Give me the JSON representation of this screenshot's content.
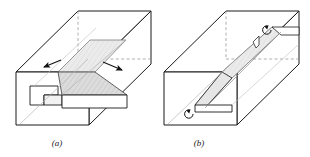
{
  "figure": {
    "background_color": "#ffffff",
    "line_color": "#1a1a1a",
    "hidden_line_color": "#8a8a8a",
    "slip_plane_fill": "#d4d4d4",
    "slip_plane_fill_light": "#e2e2e2",
    "top_face_fill": "#ffffff",
    "front_face_fill": "#ffffff"
  },
  "panels": [
    {
      "id": "a",
      "caption": "(a)",
      "caption_x": 57,
      "caption_y": 146,
      "dislocation_type": "edge",
      "annotations": [
        {
          "name": "shear-arrow-left",
          "symbol": "straight-arrow",
          "direction": "left",
          "x": 45,
          "y": 63
        },
        {
          "name": "shear-arrow-right",
          "symbol": "straight-arrow",
          "direction": "right",
          "x": 118,
          "y": 68
        }
      ]
    },
    {
      "id": "b",
      "caption": "(b)",
      "caption_x": 199,
      "caption_y": 146,
      "dislocation_type": "screw",
      "annotations": [
        {
          "name": "rotation-symbol-upper",
          "symbol": "curl-arrow",
          "direction": "counterclockwise",
          "x": 268,
          "y": 28
        },
        {
          "name": "rotation-symbol-lower",
          "symbol": "curl-arrow",
          "direction": "counterclockwise",
          "x": 190,
          "y": 112
        }
      ]
    }
  ]
}
